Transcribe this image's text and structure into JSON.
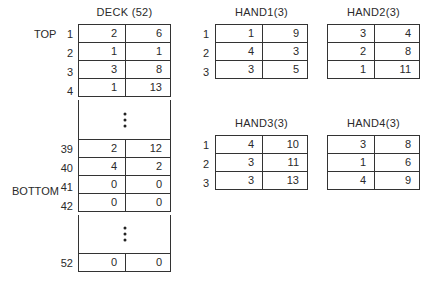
{
  "deck": {
    "title": "DECK (52)",
    "top_label": "TOP",
    "bottom_label": "BOTTOM",
    "top_rows": [
      {
        "index": "1",
        "a": "2",
        "b": "6"
      },
      {
        "index": "2",
        "a": "1",
        "b": "1"
      },
      {
        "index": "3",
        "a": "3",
        "b": "8"
      },
      {
        "index": "4",
        "a": "1",
        "b": "13"
      }
    ],
    "middle_rows": [
      {
        "index": "39",
        "a": "2",
        "b": "12"
      },
      {
        "index": "40",
        "a": "4",
        "b": "2"
      },
      {
        "index": "41",
        "a": "0",
        "b": "0"
      },
      {
        "index": "42",
        "a": "0",
        "b": "0"
      }
    ],
    "last_row": {
      "index": "52",
      "a": "0",
      "b": "0"
    },
    "ellipsis_icon": "vertical-ellipsis"
  },
  "hands": [
    {
      "title": "HAND1(3)",
      "rows": [
        {
          "index": "1",
          "a": "1",
          "b": "9"
        },
        {
          "index": "2",
          "a": "4",
          "b": "3"
        },
        {
          "index": "3",
          "a": "3",
          "b": "5"
        }
      ]
    },
    {
      "title": "HAND2(3)",
      "rows": [
        {
          "index": "",
          "a": "3",
          "b": "4"
        },
        {
          "index": "",
          "a": "2",
          "b": "8"
        },
        {
          "index": "",
          "a": "1",
          "b": "11"
        }
      ]
    },
    {
      "title": "HAND3(3)",
      "rows": [
        {
          "index": "1",
          "a": "4",
          "b": "10"
        },
        {
          "index": "2",
          "a": "3",
          "b": "11"
        },
        {
          "index": "3",
          "a": "3",
          "b": "13"
        }
      ]
    },
    {
      "title": "HAND4(3)",
      "rows": [
        {
          "index": "",
          "a": "3",
          "b": "8"
        },
        {
          "index": "",
          "a": "1",
          "b": "6"
        },
        {
          "index": "",
          "a": "4",
          "b": "9"
        }
      ]
    }
  ]
}
